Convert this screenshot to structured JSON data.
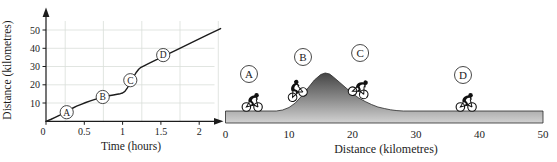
{
  "figure": {
    "background": "#ffffff",
    "ink_color": "#1c1c1c",
    "grid_color": "#d9ded9",
    "terrain_dark": "#3f3f3f",
    "terrain_light": "#d2d2d2",
    "point_labels": [
      "A",
      "B",
      "C",
      "D"
    ]
  },
  "left_chart": {
    "xlabel": "Time (hours)",
    "ylabel": "Distance (kilometres)"
  },
  "right_diagram": {
    "xlabel": "Distance (kilometres)",
    "rider_icon": "cyclist-silhouette"
  },
  "chart_data": [
    {
      "type": "line",
      "title": "",
      "xlabel": "Time (hours)",
      "ylabel": "Distance (kilometres)",
      "xlim": [
        0,
        2.3
      ],
      "ylim": [
        0,
        55
      ],
      "xticks": [
        0,
        0.5,
        1,
        1.5,
        2
      ],
      "yticks": [
        10,
        20,
        30,
        40,
        50
      ],
      "grid_x": [
        0.25,
        0.75,
        1.25,
        1.75,
        2.25
      ],
      "grid_y": [
        10,
        20,
        30,
        40,
        50
      ],
      "points": [
        [
          0,
          0
        ],
        [
          0.06,
          1
        ],
        [
          0.12,
          2.2
        ],
        [
          0.18,
          3.4
        ],
        [
          0.24,
          4.8
        ],
        [
          0.28,
          5.6
        ],
        [
          0.34,
          7
        ],
        [
          0.4,
          8.3
        ],
        [
          0.46,
          9.3
        ],
        [
          0.52,
          10.3
        ],
        [
          0.58,
          11.2
        ],
        [
          0.64,
          12
        ],
        [
          0.7,
          12.7
        ],
        [
          0.76,
          13.4
        ],
        [
          0.82,
          14
        ],
        [
          0.88,
          14.4
        ],
        [
          0.93,
          14.8
        ],
        [
          0.97,
          15.1
        ],
        [
          1,
          15.5
        ],
        [
          1.03,
          16.4
        ],
        [
          1.06,
          18.2
        ],
        [
          1.09,
          20.3
        ],
        [
          1.12,
          22.6
        ],
        [
          1.15,
          24.8
        ],
        [
          1.18,
          26.9
        ],
        [
          1.21,
          28.5
        ],
        [
          1.24,
          29.6
        ],
        [
          1.28,
          30.4
        ],
        [
          1.35,
          31.9
        ],
        [
          1.45,
          33.9
        ],
        [
          1.53,
          35.6
        ],
        [
          1.7,
          39
        ],
        [
          1.9,
          43.1
        ],
        [
          2.1,
          47.2
        ],
        [
          2.28,
          50.8
        ]
      ],
      "labeled_points": [
        {
          "label": "A",
          "x": 0.27,
          "y": 5
        },
        {
          "label": "B",
          "x": 0.74,
          "y": 13.3
        },
        {
          "label": "C",
          "x": 1.1,
          "y": 22.5
        },
        {
          "label": "D",
          "x": 1.53,
          "y": 36.3
        }
      ]
    },
    {
      "type": "area",
      "title": "",
      "xlabel": "Distance (kilometres)",
      "xlim": [
        0,
        50
      ],
      "xticks": [
        0,
        10,
        20,
        30,
        40,
        50
      ],
      "profile": [
        [
          0,
          0
        ],
        [
          8,
          0
        ],
        [
          9,
          1
        ],
        [
          10,
          3.5
        ],
        [
          11,
          8
        ],
        [
          12,
          15
        ],
        [
          13,
          23
        ],
        [
          14,
          31
        ],
        [
          15,
          36.5
        ],
        [
          15.7,
          38
        ],
        [
          16.4,
          37
        ],
        [
          17,
          34
        ],
        [
          18,
          28.5
        ],
        [
          19,
          23
        ],
        [
          20,
          17.5
        ],
        [
          21,
          13
        ],
        [
          22,
          9.5
        ],
        [
          23,
          6.5
        ],
        [
          24,
          4
        ],
        [
          25,
          2.5
        ],
        [
          26,
          1.2
        ],
        [
          27,
          0.4
        ],
        [
          28,
          0
        ],
        [
          50,
          0
        ]
      ],
      "riders": [
        {
          "label": "A",
          "km": 4.2,
          "tilt": 0
        },
        {
          "label": "B",
          "km": 11.7,
          "tilt": -27
        },
        {
          "label": "C",
          "km": 20.7,
          "tilt": 16
        },
        {
          "label": "D",
          "km": 37.9,
          "tilt": 0
        }
      ],
      "labels": [
        {
          "label": "A",
          "km": 3.7,
          "y": 74
        },
        {
          "label": "B",
          "km": 12.2,
          "y": 57
        },
        {
          "label": "C",
          "km": 21.2,
          "y": 53
        },
        {
          "label": "D",
          "km": 37.4,
          "y": 75
        }
      ]
    }
  ]
}
